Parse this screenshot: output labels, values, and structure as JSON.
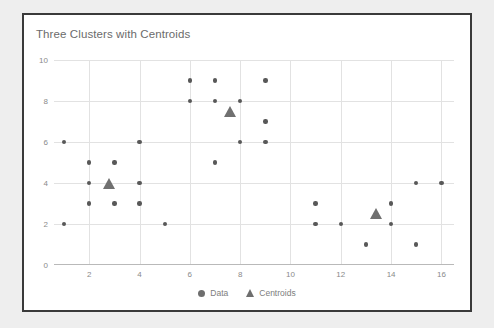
{
  "chart_data": {
    "type": "scatter",
    "title": "Three Clusters with Centroids",
    "xlabel": "",
    "ylabel": "",
    "xlim": [
      0.6,
      16.5
    ],
    "ylim": [
      0,
      10
    ],
    "grid": true,
    "legend_position": "bottom-center",
    "xticks": [
      2,
      4,
      6,
      8,
      10,
      12,
      14,
      16
    ],
    "yticks": [
      0,
      2,
      4,
      6,
      8,
      10
    ],
    "series": [
      {
        "name": "Data",
        "marker": "circle",
        "color": "#585858",
        "points": [
          [
            1,
            6
          ],
          [
            1,
            2
          ],
          [
            2,
            5
          ],
          [
            2,
            4
          ],
          [
            2,
            3
          ],
          [
            3,
            5
          ],
          [
            3,
            3
          ],
          [
            4,
            6
          ],
          [
            4,
            4
          ],
          [
            4,
            3
          ],
          [
            5,
            2
          ],
          [
            6,
            9
          ],
          [
            6,
            8
          ],
          [
            7,
            9
          ],
          [
            7,
            8
          ],
          [
            7,
            5
          ],
          [
            8,
            8
          ],
          [
            8,
            6
          ],
          [
            9,
            9
          ],
          [
            9,
            7
          ],
          [
            9,
            6
          ],
          [
            11,
            3
          ],
          [
            11,
            2
          ],
          [
            12,
            2
          ],
          [
            13,
            1
          ],
          [
            14,
            3
          ],
          [
            14,
            2
          ],
          [
            15,
            4
          ],
          [
            15,
            1
          ],
          [
            16,
            4
          ]
        ]
      },
      {
        "name": "Centroids",
        "marker": "triangle",
        "color": "#707070",
        "points": [
          [
            2.8,
            4.0
          ],
          [
            7.6,
            7.5
          ],
          [
            13.4,
            2.5
          ]
        ]
      }
    ],
    "legend": [
      {
        "label": "Data",
        "marker": "circle"
      },
      {
        "label": "Centroids",
        "marker": "triangle"
      }
    ]
  },
  "colors": {
    "border": "#3a3a3a",
    "page_background": "#eeeeee",
    "card_background": "#ffffff",
    "grid": "#e2e2e2",
    "axis": "#b9b9b9",
    "title_text": "#6b6b6b",
    "tick_text": "#8a8a8a",
    "legend_text": "#7d7d7d"
  }
}
